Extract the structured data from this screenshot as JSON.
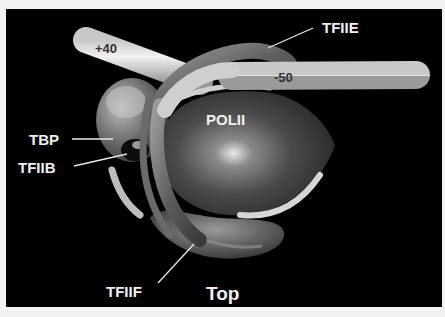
{
  "figure": {
    "view_label": "Top",
    "background": "#000000",
    "frame_color": "#f2f2f2"
  },
  "dna": {
    "upstream_label": "-50",
    "downstream_label": "+40",
    "color": "#e4e4e4"
  },
  "components": {
    "polii": "POLII",
    "tbp": "TBP",
    "tfiib": "TFIIB",
    "tfiie": "TFIIE",
    "tfiif": "TFIIF"
  }
}
